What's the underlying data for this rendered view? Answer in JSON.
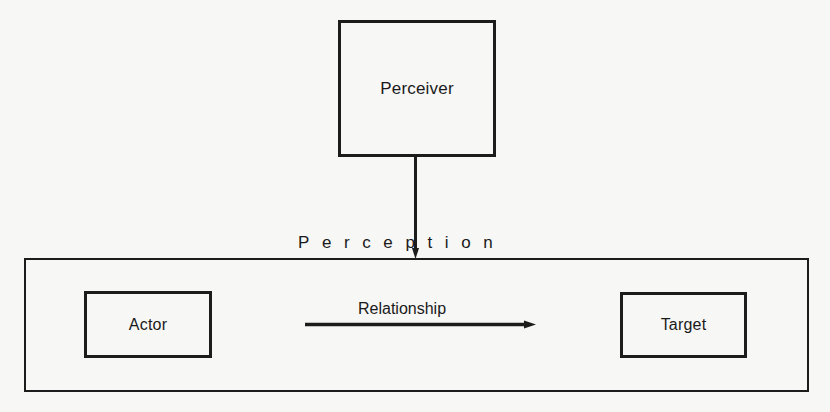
{
  "diagram": {
    "nodes": {
      "perceiver": {
        "label": "Perceiver"
      },
      "actor": {
        "label": "Actor"
      },
      "target": {
        "label": "Target"
      }
    },
    "edges": {
      "perception": {
        "label": "Perception",
        "from": "Perceiver",
        "to": "Actor-Target context"
      },
      "relationship": {
        "label": "Relationship",
        "from": "Actor",
        "to": "Target"
      }
    },
    "colors": {
      "background": "#f7f7f6",
      "stroke": "#1c1c1c"
    }
  }
}
